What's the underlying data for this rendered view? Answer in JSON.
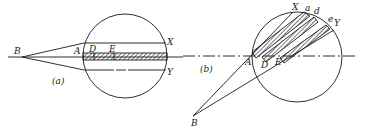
{
  "figure": {
    "panels": [
      {
        "id": "a",
        "caption": "(a)",
        "labels": {
          "B": "B",
          "A": "A",
          "D": "D",
          "E": "E",
          "X": "X",
          "Y": "Y"
        }
      },
      {
        "id": "b",
        "caption": "(b)",
        "labels": {
          "B": "B",
          "A": "A",
          "D": "D",
          "E": "E",
          "X": "X",
          "a": "a",
          "d": "d",
          "e": "e",
          "Y": "Y"
        }
      }
    ],
    "colors": {
      "ink": "#1a1a1a",
      "paper": "#ffffff"
    }
  }
}
